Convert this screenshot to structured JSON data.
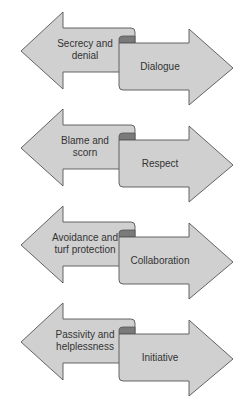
{
  "diagram": {
    "type": "opposing-arrows",
    "colors": {
      "fill": "#d0d0d0",
      "outline": "#555555",
      "fold": "#7a7a7a",
      "text": "#333333"
    },
    "pairs": [
      {
        "from": [
          "Secrecy and",
          "denial"
        ],
        "to": "Dialogue"
      },
      {
        "from": [
          "Blame and",
          "scorn"
        ],
        "to": "Respect"
      },
      {
        "from": [
          "Avoidance and",
          "turf protection"
        ],
        "to": "Collaboration"
      },
      {
        "from": [
          "Passivity and",
          "helplessness"
        ],
        "to": "Initiative"
      }
    ]
  }
}
